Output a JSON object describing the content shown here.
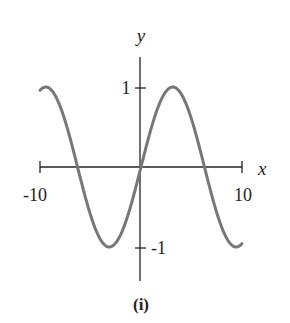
{
  "chart_data": {
    "type": "line",
    "function": "y = sin(x/2)",
    "title": "",
    "caption": "(i)",
    "xlabel": "x",
    "ylabel": "y",
    "xlim": [
      -10,
      10
    ],
    "ylim": [
      -1,
      1
    ],
    "x_ticks": [
      {
        "value": -10,
        "label": "-10"
      },
      {
        "value": 10,
        "label": "10"
      }
    ],
    "y_ticks": [
      {
        "value": 1,
        "label": "1"
      },
      {
        "value": -1,
        "label": "-1"
      }
    ],
    "grid": false,
    "legend": null,
    "series": [
      {
        "name": "curve",
        "color": "#777777",
        "x": [
          -10,
          -8,
          -6.28,
          -4,
          -3.14,
          -2,
          0,
          2,
          3.14,
          4,
          6.28,
          8,
          10
        ],
        "y": [
          0.96,
          0.76,
          0,
          -0.91,
          -1,
          -0.84,
          0,
          0.84,
          1,
          0.91,
          0,
          -0.76,
          -0.96
        ]
      }
    ]
  },
  "labels": {
    "x_axis": "x",
    "y_axis": "y",
    "x_min": "-10",
    "x_max": "10",
    "y_max": "1",
    "y_min": "-1",
    "caption": "(i)"
  },
  "colors": {
    "curve": "#777777",
    "axis": "#222222"
  }
}
